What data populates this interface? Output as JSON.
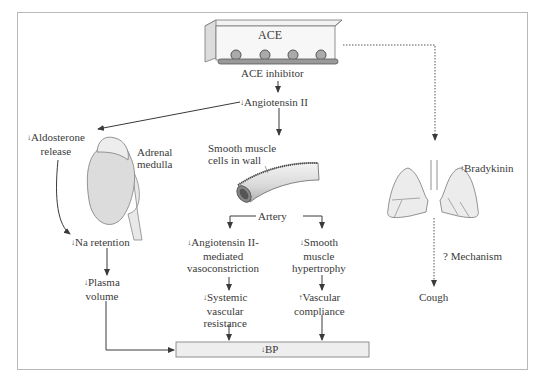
{
  "diagram": {
    "ace_label": "ACE",
    "ace_inhibitor": "ACE inhibitor",
    "angiotensin_ii": {
      "arrow": "↓",
      "text": "Angiotensin II"
    },
    "aldosterone": {
      "arrow": "↓",
      "line1": "Aldosterone",
      "line2": "release"
    },
    "adrenal": {
      "line1": "Adrenal",
      "line2": "medulla"
    },
    "smooth_muscle": {
      "line1": "Smooth muscle",
      "line2": "cells in wall"
    },
    "artery": "Artery",
    "na_retention": {
      "arrow": "↓",
      "text": "Na retention"
    },
    "plasma_volume": {
      "arrow": "↓",
      "line1": "Plasma",
      "line2": "volume"
    },
    "ang_vaso": {
      "arrow": "↓",
      "line1": "Angiotensin II-",
      "line2": "mediated",
      "line3": "vasoconstriction"
    },
    "smooth_hyper": {
      "arrow": "↓",
      "line1": "Smooth",
      "line2": "muscle",
      "line3": "hypertrophy"
    },
    "svr": {
      "arrow": "↓",
      "line1": "Systemic",
      "line2": "vascular",
      "line3": "resistance"
    },
    "compliance": {
      "arrow": "↑",
      "line1": "Vascular",
      "line2": "compliance"
    },
    "bp": {
      "arrow": "↓",
      "text": "BP"
    },
    "bradykinin": {
      "arrow": "↑",
      "text": "Bradykinin"
    },
    "mechanism": "? Mechanism",
    "cough": "Cough",
    "colors": {
      "line": "#3a3a3a",
      "organ_fill": "#e2e2e2",
      "organ_stroke": "#777777",
      "box_fill": "#eeeeee",
      "frame": "#b8b8b8"
    }
  }
}
